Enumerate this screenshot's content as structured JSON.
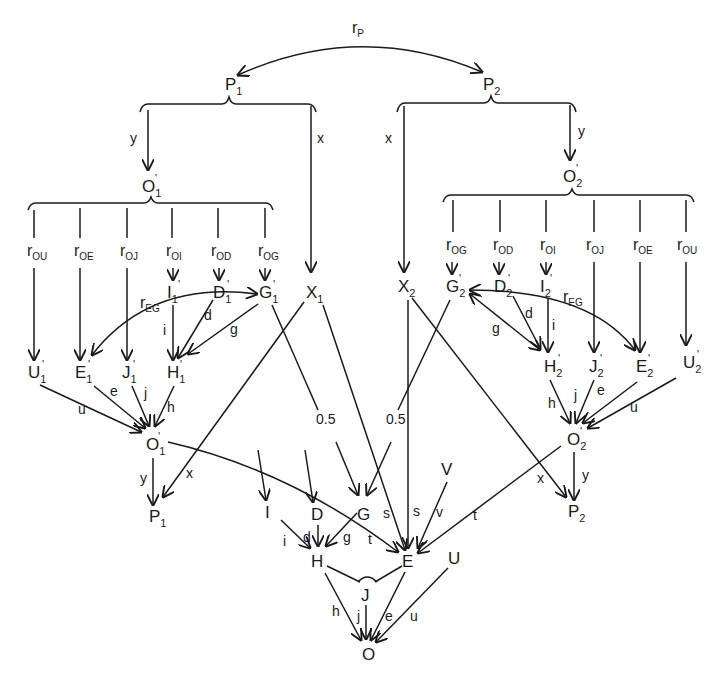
{
  "diagram": {
    "colors": {
      "ink": "#1a1a1a",
      "background": "#ffffff"
    },
    "top": {
      "correlation_label": "r",
      "correlation_sub": "P",
      "P1": {
        "main": "P",
        "sub": "1"
      },
      "P2": {
        "main": "P",
        "sub": "2"
      }
    },
    "paths": {
      "x": "x",
      "y": "y",
      "half": "0.5"
    },
    "left": {
      "O1p": {
        "main": "O",
        "sub": "1",
        "prime": "'"
      },
      "r_labels": [
        {
          "main": "r",
          "sub": "OU"
        },
        {
          "main": "r",
          "sub": "OE"
        },
        {
          "main": "r",
          "sub": "OJ"
        },
        {
          "main": "r",
          "sub": "OI"
        },
        {
          "main": "r",
          "sub": "OD"
        },
        {
          "main": "r",
          "sub": "OG"
        }
      ],
      "upper_nodes": [
        {
          "main": "I",
          "sub": "1",
          "prime": "'"
        },
        {
          "main": "D",
          "sub": "1",
          "prime": "'"
        },
        {
          "main": "G",
          "sub": "1",
          "prime": "'"
        },
        {
          "main": "X",
          "sub": "1",
          "prime": ""
        }
      ],
      "lower_nodes": [
        {
          "main": "U",
          "sub": "1",
          "prime": "'"
        },
        {
          "main": "E",
          "sub": "1",
          "prime": "'"
        },
        {
          "main": "J",
          "sub": "1",
          "prime": "'"
        },
        {
          "main": "H",
          "sub": "1",
          "prime": "'"
        }
      ],
      "rEG": {
        "main": "r",
        "sub": "EG"
      },
      "edge_labels": {
        "d": "d",
        "g": "g",
        "i": "i",
        "u": "u",
        "e": "e",
        "j": "j",
        "h": "h"
      },
      "O1": {
        "main": "O",
        "sub": "1",
        "prime": "'"
      },
      "P1b": {
        "main": "P",
        "sub": "1"
      }
    },
    "right": {
      "O2p": {
        "main": "O",
        "sub": "2",
        "prime": "'"
      },
      "r_labels": [
        {
          "main": "r",
          "sub": "OG"
        },
        {
          "main": "r",
          "sub": "OD"
        },
        {
          "main": "r",
          "sub": "OI"
        },
        {
          "main": "r",
          "sub": "OJ"
        },
        {
          "main": "r",
          "sub": "OE"
        },
        {
          "main": "r",
          "sub": "OU"
        }
      ],
      "upper_nodes": [
        {
          "main": "X",
          "sub": "2",
          "prime": ""
        },
        {
          "main": "G",
          "sub": "2",
          "prime": "'"
        },
        {
          "main": "D",
          "sub": "2",
          "prime": "'"
        },
        {
          "main": "I",
          "sub": "2",
          "prime": "'"
        }
      ],
      "lower_nodes": [
        {
          "main": "H",
          "sub": "2",
          "prime": "'"
        },
        {
          "main": "J",
          "sub": "2",
          "prime": "'"
        },
        {
          "main": "E",
          "sub": "2",
          "prime": "'"
        },
        {
          "main": "U",
          "sub": "2",
          "prime": "'"
        }
      ],
      "rEG": {
        "main": "r",
        "sub": "EG"
      },
      "edge_labels": {
        "d": "d",
        "g": "g",
        "i": "i",
        "u": "u",
        "e": "e",
        "j": "j",
        "h": "h"
      },
      "O2": {
        "main": "O",
        "sub": "2",
        "prime": "'"
      },
      "P2b": {
        "main": "P",
        "sub": "2"
      }
    },
    "center": {
      "nodes": {
        "I": "I",
        "D": "D",
        "G": "G",
        "V": "V",
        "H": "H",
        "E": "E",
        "U": "U",
        "J": "J",
        "O": "O"
      },
      "edge_labels": {
        "d": "d",
        "g": "g",
        "i": "i",
        "s": "s",
        "t": "t",
        "v": "v",
        "h": "h",
        "j": "j",
        "e": "e",
        "u": "u"
      }
    }
  }
}
